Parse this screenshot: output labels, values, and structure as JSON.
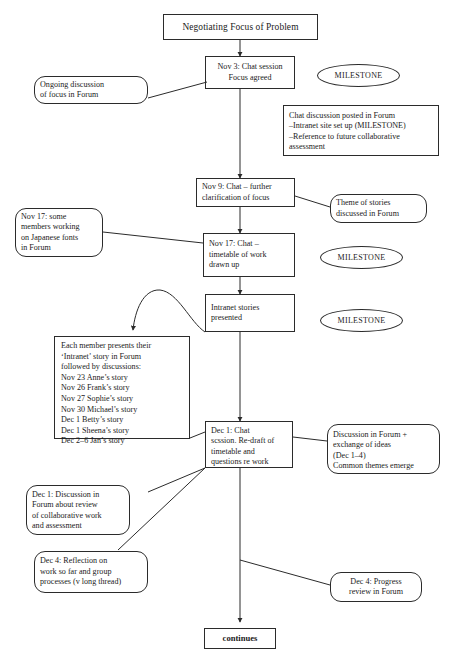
{
  "diagram": {
    "title": "Negotiating Focus of Problem",
    "nodes": {
      "title_box": "Negotiating Focus of Problem",
      "nov3_chat": "Nov 3: Chat session\nFocus agreed",
      "ongoing_discussion": "Ongoing discussion\nof focus in Forum",
      "chat_posted": "  Chat discussion posted in Forum\n–Intranet site set up (MILESTONE)\n–Reference to future collaborative\n  assessment",
      "nov9_chat": "Nov 9: Chat – further\nclarification of focus",
      "theme_of_stories": "Theme of stories\ndiscussed in Forum",
      "nov17_japanese": "Nov 17: some\nmembers working\non Japanese fonts\nin Forum",
      "nov17_chat": "Nov 17: Chat –\ntimetable of work\ndrawn up",
      "intranet_stories": "Intranet stories\npresented",
      "member_stories": "Each member presents their\n‘Intranet’ story in Forum\nfollowed by discussions:\nNov 23 Anne’s story\nNov 26 Frank’s story\nNov 27 Sophie’s story\nNov 30 Michael’s story\nDec 1 Betty’s story\nDec 1 Sheena’s story\nDec 2–6 Jan’s story",
      "dec1_chat": "Dec 1: Chat\nscssion. Re-draft of\ntimetable and\nquestions re work",
      "discussion_exchange": "Discussion in Forum +\nexchange of ideas\n(Dec 1–4)\nCommon themes emerge",
      "dec1_discussion": "Dec 1: Discussion  in\nForum about review\nof collaborative work\nand assessment",
      "dec4_reflection": "Dec 4: Reflection on\nwork so far and group\nprocesses (v long thread)",
      "dec4_progress": "Dec 4: Progress\nreview in Forum",
      "continues": "continues"
    },
    "milestones": {
      "milestone_1": "MILESTONE",
      "milestone_2": "MILESTONE",
      "milestone_3": "MILESTONE"
    },
    "colors": {
      "stroke": "#2b2b2b",
      "background": "#ffffff",
      "text": "#1b1b1b"
    }
  }
}
